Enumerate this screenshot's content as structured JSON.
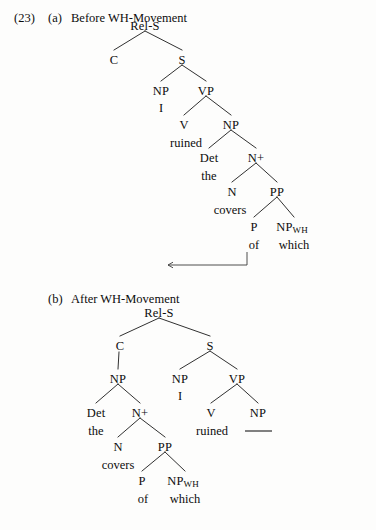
{
  "figure": {
    "number": "(23)",
    "panels": [
      {
        "id": "a",
        "letter": "(a)",
        "caption": "Before WH-Movement"
      },
      {
        "id": "b",
        "letter": "(b)",
        "caption": "After WH-Movement"
      }
    ]
  },
  "labels": {
    "rel_s": "Rel-S",
    "c": "C",
    "s": "S",
    "np": "NP",
    "vp": "VP",
    "v": "V",
    "det": "Det",
    "n_plus": "N+",
    "n": "N",
    "pp": "PP",
    "p": "P",
    "np_wh": "NP",
    "wh_sub": "WH"
  },
  "terminals": {
    "i": "I",
    "ruined": "ruined",
    "the": "the",
    "covers": "covers",
    "of": "of",
    "which": "which",
    "trace": ""
  },
  "tree_a": {
    "nodes": [
      {
        "key": "rel_s",
        "text": "Rel-S",
        "x": 145,
        "y": 25
      },
      {
        "key": "c",
        "text": "C",
        "x": 114,
        "y": 59
      },
      {
        "key": "s",
        "text": "S",
        "x": 182,
        "y": 59
      },
      {
        "key": "np_subj",
        "text": "NP",
        "x": 161,
        "y": 90
      },
      {
        "key": "vp",
        "text": "VP",
        "x": 206,
        "y": 90
      },
      {
        "key": "v",
        "text": "V",
        "x": 184,
        "y": 124
      },
      {
        "key": "np_obj",
        "text": "NP",
        "x": 231,
        "y": 124
      },
      {
        "key": "det",
        "text": "Det",
        "x": 209,
        "y": 157
      },
      {
        "key": "n_plus",
        "text": "N+",
        "x": 256,
        "y": 157
      },
      {
        "key": "n",
        "text": "N",
        "x": 232,
        "y": 191
      },
      {
        "key": "pp",
        "text": "PP",
        "x": 277,
        "y": 191
      },
      {
        "key": "p",
        "text": "P",
        "x": 254,
        "y": 226
      },
      {
        "key": "np_wh",
        "text": "NP",
        "x": 292,
        "y": 226
      }
    ],
    "terminals": [
      {
        "key": "i",
        "text": "I",
        "x": 161,
        "y": 107
      },
      {
        "key": "ruined",
        "text": "ruined",
        "x": 186,
        "y": 142
      },
      {
        "key": "the",
        "text": "the",
        "x": 209,
        "y": 175
      },
      {
        "key": "covers",
        "text": "covers",
        "x": 230,
        "y": 209
      },
      {
        "key": "of",
        "text": "of",
        "x": 254,
        "y": 244
      },
      {
        "key": "which",
        "text": "which",
        "x": 294,
        "y": 244
      }
    ],
    "movement_arrow": {
      "from_x": 247,
      "from_y": 252,
      "to_x": 167,
      "to_y": 265
    }
  },
  "tree_b": {
    "nodes": [
      {
        "key": "rel_s",
        "text": "Rel-S",
        "x": 159,
        "y": 312
      },
      {
        "key": "c",
        "text": "C",
        "x": 120,
        "y": 345
      },
      {
        "key": "s",
        "text": "S",
        "x": 210,
        "y": 345
      },
      {
        "key": "np_rel",
        "text": "NP",
        "x": 118,
        "y": 378
      },
      {
        "key": "np_subj",
        "text": "NP",
        "x": 180,
        "y": 378
      },
      {
        "key": "vp",
        "text": "VP",
        "x": 237,
        "y": 378
      },
      {
        "key": "det",
        "text": "Det",
        "x": 96,
        "y": 412
      },
      {
        "key": "n_plus",
        "text": "N+",
        "x": 140,
        "y": 412
      },
      {
        "key": "v",
        "text": "V",
        "x": 211,
        "y": 412
      },
      {
        "key": "np_trace",
        "text": "NP",
        "x": 258,
        "y": 412
      },
      {
        "key": "n",
        "text": "N",
        "x": 118,
        "y": 446
      },
      {
        "key": "pp",
        "text": "PP",
        "x": 165,
        "y": 446
      },
      {
        "key": "p",
        "text": "P",
        "x": 142,
        "y": 480
      },
      {
        "key": "np_wh",
        "text": "NP",
        "x": 183,
        "y": 480
      }
    ],
    "terminals": [
      {
        "key": "the",
        "text": "the",
        "x": 96,
        "y": 430
      },
      {
        "key": "i",
        "text": "I",
        "x": 180,
        "y": 395
      },
      {
        "key": "ruined",
        "text": "ruined",
        "x": 212,
        "y": 430
      },
      {
        "key": "covers",
        "text": "covers",
        "x": 118,
        "y": 464
      },
      {
        "key": "of",
        "text": "of",
        "x": 143,
        "y": 498
      },
      {
        "key": "which",
        "text": "which",
        "x": 185,
        "y": 498
      }
    ],
    "trace_line": {
      "x1": 245,
      "x2": 272,
      "y": 431
    }
  },
  "style": {
    "ink": "#0d0d0d",
    "line": "#1a1a1a",
    "page_bg": "#fdfdfc"
  }
}
